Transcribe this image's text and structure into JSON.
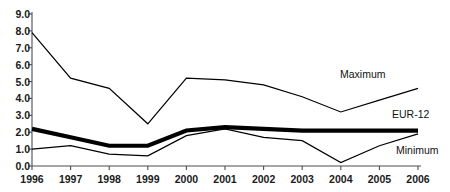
{
  "chart_data": {
    "type": "line",
    "title": "",
    "subtitle": "",
    "xlabel": "",
    "ylabel": "",
    "categories": [
      "1996",
      "1997",
      "1998",
      "1999",
      "2000",
      "2001",
      "2002",
      "2003",
      "2004",
      "2005",
      "2006"
    ],
    "x": [
      1996,
      1997,
      1998,
      1999,
      2000,
      2001,
      2002,
      2003,
      2004,
      2005,
      2006
    ],
    "ylim": [
      0.0,
      9.0
    ],
    "ytick_labels": [
      "0.0",
      "1.0",
      "2.0",
      "3.0",
      "4.0",
      "5.0",
      "6.0",
      "7.0",
      "8.0",
      "9.0"
    ],
    "ytick_values": [
      0.0,
      1.0,
      2.0,
      3.0,
      4.0,
      5.0,
      6.0,
      7.0,
      8.0,
      9.0
    ],
    "grid": false,
    "legend_position": "inline-right",
    "series": [
      {
        "name": "Maximum",
        "values": [
          7.9,
          5.2,
          4.6,
          2.5,
          5.2,
          5.1,
          4.8,
          4.1,
          3.2,
          3.9,
          4.6
        ],
        "color": "#000000",
        "line_width": 1.2,
        "label": "Maximum"
      },
      {
        "name": "EUR-12",
        "values": [
          2.2,
          1.7,
          1.2,
          1.2,
          2.1,
          2.3,
          2.2,
          2.1,
          2.1,
          2.1,
          2.1
        ],
        "color": "#000000",
        "line_width": 4.2,
        "label": "EUR-12"
      },
      {
        "name": "Minimum",
        "values": [
          1.0,
          1.2,
          0.7,
          0.6,
          1.8,
          2.2,
          1.7,
          1.5,
          0.2,
          1.2,
          1.9
        ],
        "color": "#000000",
        "line_width": 1.2,
        "label": "Minimum"
      }
    ],
    "annotations": [
      {
        "text": "Maximum",
        "x_px": 340,
        "y_px": 68
      },
      {
        "text": "EUR-12",
        "x_px": 392,
        "y_px": 115
      },
      {
        "text": "Minimum",
        "x_px": 398,
        "y_px": 149
      }
    ],
    "axis_color": "#4d4d4d",
    "background": "#ffffff"
  }
}
